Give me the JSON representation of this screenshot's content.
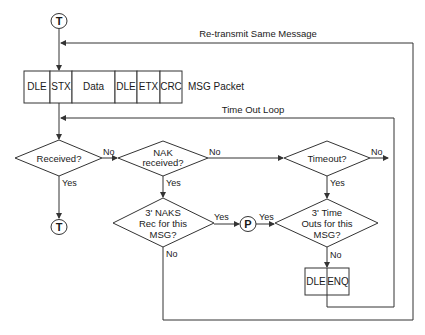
{
  "diagram": {
    "connectors": {
      "top": "T",
      "bottom": "T",
      "p": "P"
    },
    "labels": {
      "retransmit": "Re-transmit Same Message",
      "msg_packet": "MSG Packet",
      "time_out_loop": "Time Out Loop"
    },
    "packet": [
      "DLE",
      "STX",
      "Data",
      "DLE",
      "ETX",
      "CRC"
    ],
    "decisions": {
      "received": "Received?",
      "nak_line1": "NAK",
      "nak_line2": "received?",
      "timeout": "Timeout?",
      "naks_line1": "3' NAKS",
      "naks_line2": "Rec for this",
      "naks_line3": "MSG?",
      "tos_line1": "3' Time",
      "tos_line2": "Outs for this",
      "tos_line3": "MSG?"
    },
    "edges": {
      "received_no": "No",
      "received_yes": "Yes",
      "nak_no": "No",
      "nak_yes": "Yes",
      "timeout_no": "No",
      "timeout_yes": "Yes",
      "naks_yes": "Yes",
      "p_yes": "Yes",
      "naks_no": "No",
      "tos_no": "No"
    },
    "enq_box": [
      "DLE",
      "ENQ"
    ]
  }
}
